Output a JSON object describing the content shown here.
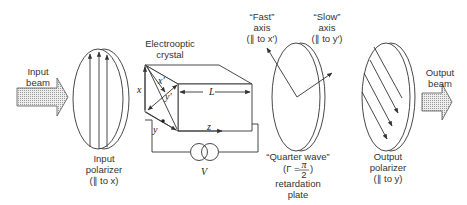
{
  "diagram": {
    "labels": {
      "input_beam": [
        "Input",
        "beam"
      ],
      "input_polarizer": [
        "Input",
        "polarizer",
        "(∥ to x)"
      ],
      "crystal": [
        "Electrooptic",
        "crystal"
      ],
      "length": "L",
      "voltage": "V",
      "axis_x": "x",
      "axis_y": "y",
      "axis_xp": "x′",
      "axis_yp": "y′",
      "axis_z": "z",
      "fast_axis": [
        "“Fast”",
        "axis",
        "(∥ to x′)"
      ],
      "slow_axis": [
        "“Slow”",
        "axis",
        "(∥ to y′)"
      ],
      "quarter_wave": [
        "“Quarter  wave”",
        "(Γ = ",
        "π",
        "2",
        " )",
        "retardation",
        "plate"
      ],
      "output_polarizer": [
        "Output",
        "polarizer",
        "(∥ to y)"
      ],
      "output_beam": [
        "Output",
        "beam"
      ]
    },
    "colors": {
      "line": "#333333",
      "beam_fill": "#d9d9d9"
    }
  }
}
